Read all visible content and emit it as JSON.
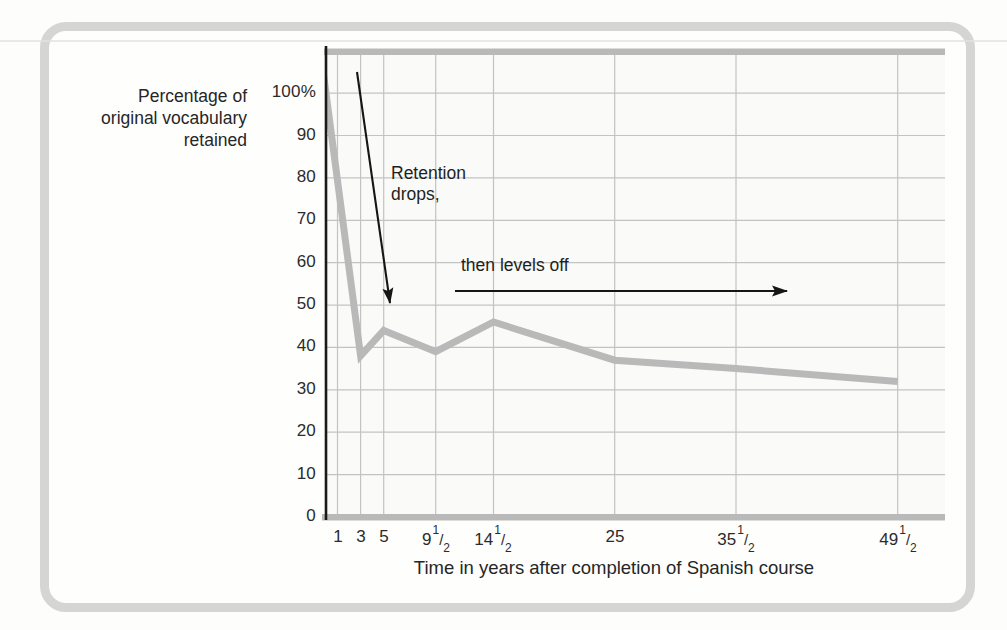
{
  "chart_data": {
    "type": "line",
    "ylabel_lines": [
      "Percentage of",
      "original vocabulary",
      "retained"
    ],
    "xlabel": "Time in years after completion of Spanish course",
    "xlim": [
      0,
      53.6
    ],
    "ylim": [
      0,
      109.7
    ],
    "grid": true,
    "x_ticks": [
      {
        "v": 1,
        "base": "1"
      },
      {
        "v": 3,
        "base": "3"
      },
      {
        "v": 5,
        "base": "5"
      },
      {
        "v": 9.5,
        "base": "9",
        "frac": "1/2"
      },
      {
        "v": 14.5,
        "base": "14",
        "frac": "1/2"
      },
      {
        "v": 25,
        "base": "25"
      },
      {
        "v": 35.5,
        "base": "35",
        "frac": "1/2"
      },
      {
        "v": 49.5,
        "base": "49",
        "frac": "1/2"
      }
    ],
    "y_ticks": [
      {
        "v": 0,
        "label": "0"
      },
      {
        "v": 10,
        "label": "10"
      },
      {
        "v": 20,
        "label": "20"
      },
      {
        "v": 30,
        "label": "30"
      },
      {
        "v": 40,
        "label": "40"
      },
      {
        "v": 50,
        "label": "50"
      },
      {
        "v": 60,
        "label": "60"
      },
      {
        "v": 70,
        "label": "70"
      },
      {
        "v": 80,
        "label": "80"
      },
      {
        "v": 90,
        "label": "90"
      },
      {
        "v": 100,
        "label": "100%"
      }
    ],
    "series": [
      {
        "name": "vocabulary-retention",
        "x": [
          0,
          3,
          5,
          9.5,
          14.5,
          25,
          35.5,
          49.5
        ],
        "y": [
          100,
          38,
          44,
          39,
          46,
          37,
          35,
          32
        ]
      }
    ],
    "annotations": [
      {
        "id": "retention-drops",
        "lines": [
          "Retention",
          "drops,"
        ],
        "arrow": {
          "from_px": [
            357,
            72
          ],
          "to_px": [
            390,
            303
          ]
        }
      },
      {
        "id": "levels-off",
        "lines": [
          "then levels off"
        ],
        "arrow": {
          "from_px": [
            455,
            291
          ],
          "to_px": [
            787,
            291
          ]
        }
      }
    ],
    "colors": {
      "line": "#b9b9b9",
      "grid": "#c3c3c3",
      "axis": "#1a1a1a",
      "arrow": "#161616",
      "text": "#262626",
      "panel_border": "#d5d5d3",
      "plot_bg": "#fafaf8"
    },
    "legend": null,
    "title": ""
  }
}
